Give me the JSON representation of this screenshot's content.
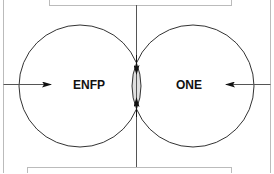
{
  "diagram": {
    "type": "venn-two-set",
    "left_set": {
      "label": "ENFP"
    },
    "right_set": {
      "label": "ONE"
    },
    "colors": {
      "stroke": "#333333",
      "frame": "#bbbbbb",
      "overlap_fill": "#e0e0e0",
      "text": "#111111"
    }
  }
}
